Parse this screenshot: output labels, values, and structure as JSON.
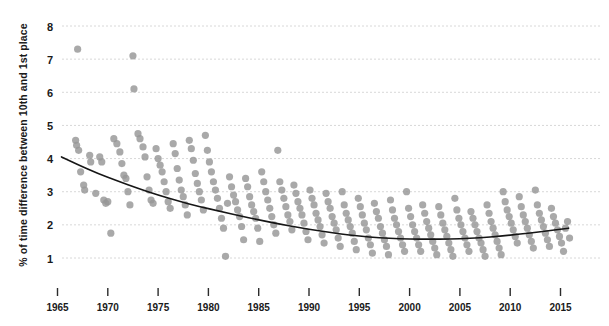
{
  "chart_data": {
    "type": "scatter",
    "title": "",
    "xlabel": "",
    "ylabel": "% of time difference between 10th and 1st place",
    "xlim": [
      1964.2,
      2016.2
    ],
    "ylim": [
      0.45,
      8.35
    ],
    "grid": true,
    "legend": null,
    "x_ticks": [
      1965,
      1970,
      1975,
      1980,
      1985,
      1990,
      1995,
      2000,
      2005,
      2010,
      2015
    ],
    "x_tick_labels": [
      "1965",
      "1970",
      "1975",
      "1980",
      "1985",
      "1990",
      "1995",
      "2000",
      "2005",
      "2010",
      "2015"
    ],
    "y_ticks": [
      1,
      2,
      3,
      4,
      5,
      6,
      7,
      8
    ],
    "y_tick_labels": [
      "1",
      "2",
      "3",
      "4",
      "5",
      "6",
      "7",
      "8"
    ],
    "point_color": "#969696",
    "trend_color": "#161616",
    "grid_color": "#d8d8d8",
    "background_color": "#ffffff",
    "points": [
      [
        1967.0,
        7.3
      ],
      [
        1972.5,
        7.1
      ],
      [
        1972.6,
        6.1
      ],
      [
        1966.8,
        4.55
      ],
      [
        1966.9,
        4.4
      ],
      [
        1967.1,
        4.25
      ],
      [
        1967.3,
        3.6
      ],
      [
        1967.6,
        3.2
      ],
      [
        1967.7,
        3.05
      ],
      [
        1968.2,
        4.1
      ],
      [
        1968.3,
        3.9
      ],
      [
        1968.8,
        2.95
      ],
      [
        1969.2,
        4.05
      ],
      [
        1969.4,
        3.9
      ],
      [
        1969.6,
        2.75
      ],
      [
        1969.8,
        2.65
      ],
      [
        1970.0,
        2.7
      ],
      [
        1970.3,
        1.75
      ],
      [
        1970.6,
        4.6
      ],
      [
        1970.9,
        4.45
      ],
      [
        1971.2,
        4.2
      ],
      [
        1971.4,
        3.85
      ],
      [
        1971.6,
        3.5
      ],
      [
        1971.8,
        3.4
      ],
      [
        1972.0,
        3.0
      ],
      [
        1972.2,
        2.6
      ],
      [
        1973.0,
        4.75
      ],
      [
        1973.2,
        4.6
      ],
      [
        1973.5,
        4.35
      ],
      [
        1973.7,
        4.05
      ],
      [
        1973.9,
        3.45
      ],
      [
        1974.1,
        3.05
      ],
      [
        1974.3,
        2.75
      ],
      [
        1974.5,
        2.65
      ],
      [
        1974.8,
        4.3
      ],
      [
        1975.0,
        4.0
      ],
      [
        1975.2,
        3.8
      ],
      [
        1975.4,
        3.6
      ],
      [
        1975.6,
        3.3
      ],
      [
        1975.8,
        3.0
      ],
      [
        1976.0,
        2.7
      ],
      [
        1976.2,
        2.5
      ],
      [
        1976.5,
        4.45
      ],
      [
        1976.7,
        4.15
      ],
      [
        1976.9,
        3.7
      ],
      [
        1977.1,
        3.35
      ],
      [
        1977.3,
        3.05
      ],
      [
        1977.5,
        2.85
      ],
      [
        1977.7,
        2.6
      ],
      [
        1977.9,
        2.3
      ],
      [
        1978.1,
        4.55
      ],
      [
        1978.3,
        4.3
      ],
      [
        1978.5,
        3.95
      ],
      [
        1978.7,
        3.55
      ],
      [
        1978.9,
        3.25
      ],
      [
        1979.1,
        3.0
      ],
      [
        1979.3,
        2.75
      ],
      [
        1979.5,
        2.45
      ],
      [
        1979.7,
        4.7
      ],
      [
        1979.9,
        4.25
      ],
      [
        1980.1,
        3.9
      ],
      [
        1980.3,
        3.6
      ],
      [
        1980.5,
        3.3
      ],
      [
        1980.7,
        3.05
      ],
      [
        1980.9,
        2.8
      ],
      [
        1981.1,
        2.5
      ],
      [
        1981.3,
        2.2
      ],
      [
        1981.5,
        1.9
      ],
      [
        1981.7,
        1.05
      ],
      [
        1981.9,
        2.65
      ],
      [
        1982.1,
        3.45
      ],
      [
        1982.3,
        3.15
      ],
      [
        1982.5,
        2.9
      ],
      [
        1982.7,
        2.7
      ],
      [
        1982.9,
        2.45
      ],
      [
        1983.1,
        2.25
      ],
      [
        1983.3,
        1.95
      ],
      [
        1983.5,
        1.55
      ],
      [
        1983.7,
        3.4
      ],
      [
        1983.9,
        3.15
      ],
      [
        1984.1,
        2.85
      ],
      [
        1984.3,
        2.6
      ],
      [
        1984.5,
        2.4
      ],
      [
        1984.7,
        2.2
      ],
      [
        1984.9,
        1.9
      ],
      [
        1985.1,
        1.5
      ],
      [
        1985.3,
        3.6
      ],
      [
        1985.5,
        3.3
      ],
      [
        1985.7,
        3.0
      ],
      [
        1985.9,
        2.75
      ],
      [
        1986.1,
        2.5
      ],
      [
        1986.3,
        2.25
      ],
      [
        1986.5,
        2.0
      ],
      [
        1986.7,
        1.75
      ],
      [
        1986.9,
        4.25
      ],
      [
        1987.1,
        3.3
      ],
      [
        1987.3,
        3.05
      ],
      [
        1987.5,
        2.8
      ],
      [
        1987.7,
        2.55
      ],
      [
        1987.9,
        2.3
      ],
      [
        1988.1,
        2.1
      ],
      [
        1988.3,
        1.85
      ],
      [
        1988.5,
        3.2
      ],
      [
        1988.7,
        2.95
      ],
      [
        1988.9,
        2.7
      ],
      [
        1989.1,
        2.5
      ],
      [
        1989.3,
        2.3
      ],
      [
        1989.5,
        2.05
      ],
      [
        1989.7,
        1.8
      ],
      [
        1989.9,
        1.55
      ],
      [
        1990.1,
        3.05
      ],
      [
        1990.3,
        2.8
      ],
      [
        1990.5,
        2.6
      ],
      [
        1990.7,
        2.35
      ],
      [
        1990.9,
        2.15
      ],
      [
        1991.1,
        1.95
      ],
      [
        1991.3,
        1.7
      ],
      [
        1991.5,
        1.45
      ],
      [
        1991.7,
        2.95
      ],
      [
        1991.9,
        2.7
      ],
      [
        1992.1,
        2.5
      ],
      [
        1992.3,
        2.25
      ],
      [
        1992.5,
        2.05
      ],
      [
        1992.7,
        1.85
      ],
      [
        1992.9,
        1.6
      ],
      [
        1993.1,
        1.35
      ],
      [
        1993.3,
        3.0
      ],
      [
        1993.5,
        2.6
      ],
      [
        1993.7,
        2.35
      ],
      [
        1993.9,
        2.15
      ],
      [
        1994.1,
        1.95
      ],
      [
        1994.3,
        1.75
      ],
      [
        1994.5,
        1.5
      ],
      [
        1994.7,
        1.25
      ],
      [
        1994.9,
        2.8
      ],
      [
        1995.1,
        2.55
      ],
      [
        1995.3,
        2.3
      ],
      [
        1995.5,
        2.05
      ],
      [
        1995.7,
        1.85
      ],
      [
        1995.9,
        1.6
      ],
      [
        1996.1,
        1.4
      ],
      [
        1996.3,
        1.15
      ],
      [
        1996.5,
        2.65
      ],
      [
        1996.7,
        2.4
      ],
      [
        1996.9,
        2.2
      ],
      [
        1997.1,
        1.95
      ],
      [
        1997.3,
        1.75
      ],
      [
        1997.5,
        1.55
      ],
      [
        1997.7,
        1.35
      ],
      [
        1997.9,
        1.1
      ],
      [
        1998.1,
        2.75
      ],
      [
        1998.3,
        2.45
      ],
      [
        1998.5,
        2.2
      ],
      [
        1998.7,
        2.0
      ],
      [
        1998.9,
        1.8
      ],
      [
        1999.1,
        1.6
      ],
      [
        1999.3,
        1.4
      ],
      [
        1999.5,
        1.2
      ],
      [
        1999.7,
        3.0
      ],
      [
        1999.9,
        2.5
      ],
      [
        2000.1,
        2.25
      ],
      [
        2000.3,
        2.0
      ],
      [
        2000.5,
        1.8
      ],
      [
        2000.7,
        1.6
      ],
      [
        2000.9,
        1.4
      ],
      [
        2001.1,
        1.2
      ],
      [
        2001.3,
        2.6
      ],
      [
        2001.5,
        2.35
      ],
      [
        2001.7,
        2.1
      ],
      [
        2001.9,
        1.9
      ],
      [
        2002.1,
        1.7
      ],
      [
        2002.3,
        1.5
      ],
      [
        2002.5,
        1.3
      ],
      [
        2002.7,
        1.1
      ],
      [
        2002.9,
        2.55
      ],
      [
        2003.1,
        2.3
      ],
      [
        2003.3,
        2.05
      ],
      [
        2003.5,
        1.85
      ],
      [
        2003.7,
        1.65
      ],
      [
        2003.9,
        1.45
      ],
      [
        2004.1,
        1.25
      ],
      [
        2004.3,
        1.05
      ],
      [
        2004.5,
        2.8
      ],
      [
        2004.7,
        2.45
      ],
      [
        2004.9,
        2.2
      ],
      [
        2005.1,
        2.0
      ],
      [
        2005.3,
        1.8
      ],
      [
        2005.5,
        1.6
      ],
      [
        2005.7,
        1.4
      ],
      [
        2005.9,
        1.2
      ],
      [
        2006.1,
        2.4
      ],
      [
        2006.3,
        2.2
      ],
      [
        2006.5,
        2.0
      ],
      [
        2006.7,
        1.8
      ],
      [
        2006.9,
        1.6
      ],
      [
        2007.1,
        1.45
      ],
      [
        2007.3,
        1.25
      ],
      [
        2007.5,
        1.05
      ],
      [
        2007.7,
        2.6
      ],
      [
        2007.9,
        2.35
      ],
      [
        2008.1,
        2.1
      ],
      [
        2008.3,
        1.9
      ],
      [
        2008.5,
        1.7
      ],
      [
        2008.7,
        1.5
      ],
      [
        2008.9,
        1.3
      ],
      [
        2009.1,
        1.1
      ],
      [
        2009.3,
        3.0
      ],
      [
        2009.5,
        2.7
      ],
      [
        2009.7,
        2.45
      ],
      [
        2009.9,
        2.25
      ],
      [
        2010.1,
        2.05
      ],
      [
        2010.3,
        1.85
      ],
      [
        2010.5,
        1.65
      ],
      [
        2010.7,
        1.45
      ],
      [
        2010.9,
        2.85
      ],
      [
        2011.1,
        2.55
      ],
      [
        2011.3,
        2.3
      ],
      [
        2011.5,
        2.1
      ],
      [
        2011.7,
        1.9
      ],
      [
        2011.9,
        1.7
      ],
      [
        2012.1,
        1.5
      ],
      [
        2012.3,
        1.3
      ],
      [
        2012.5,
        3.05
      ],
      [
        2012.7,
        2.6
      ],
      [
        2012.9,
        2.35
      ],
      [
        2013.1,
        2.15
      ],
      [
        2013.3,
        1.95
      ],
      [
        2013.5,
        1.75
      ],
      [
        2013.7,
        1.55
      ],
      [
        2013.9,
        1.35
      ],
      [
        2014.1,
        2.5
      ],
      [
        2014.3,
        2.25
      ],
      [
        2014.5,
        2.05
      ],
      [
        2014.7,
        1.85
      ],
      [
        2014.9,
        1.65
      ],
      [
        2015.1,
        1.45
      ],
      [
        2015.3,
        1.2
      ],
      [
        2015.5,
        1.9
      ],
      [
        2015.7,
        2.1
      ],
      [
        2015.9,
        1.6
      ]
    ],
    "trend_line": [
      [
        1965.4,
        4.05
      ],
      [
        1967.0,
        3.82
      ],
      [
        1969.0,
        3.55
      ],
      [
        1971.0,
        3.32
      ],
      [
        1973.0,
        3.1
      ],
      [
        1975.0,
        2.9
      ],
      [
        1977.0,
        2.72
      ],
      [
        1979.0,
        2.56
      ],
      [
        1981.0,
        2.42
      ],
      [
        1983.0,
        2.28
      ],
      [
        1985.0,
        2.15
      ],
      [
        1987.0,
        2.03
      ],
      [
        1989.0,
        1.92
      ],
      [
        1991.0,
        1.82
      ],
      [
        1993.0,
        1.73
      ],
      [
        1995.0,
        1.66
      ],
      [
        1997.0,
        1.61
      ],
      [
        1999.0,
        1.58
      ],
      [
        2001.0,
        1.57
      ],
      [
        2003.0,
        1.57
      ],
      [
        2005.0,
        1.58
      ],
      [
        2007.0,
        1.61
      ],
      [
        2009.0,
        1.66
      ],
      [
        2011.0,
        1.72
      ],
      [
        2013.0,
        1.79
      ],
      [
        2015.0,
        1.87
      ],
      [
        2015.8,
        1.9
      ]
    ]
  },
  "axis": {
    "y_title": "% of time difference between 10th and 1st place"
  }
}
